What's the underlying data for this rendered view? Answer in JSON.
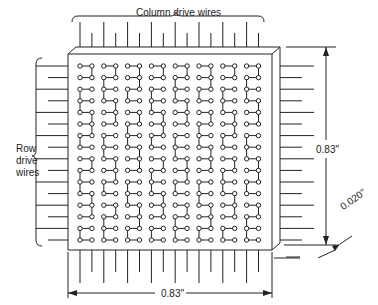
{
  "diagram": {
    "labels": {
      "column_wires": "Column drive wires",
      "row_wires_line1": "Row",
      "row_wires_line2": "drive",
      "row_wires_line3": "wires",
      "height_dim": "0.83\"",
      "width_dim": "0.83\"",
      "thickness_dim": "0.020\""
    },
    "grid": {
      "columns": 16,
      "rows": 16
    },
    "colors": {
      "line": "#222222",
      "background": "#ffffff"
    }
  }
}
